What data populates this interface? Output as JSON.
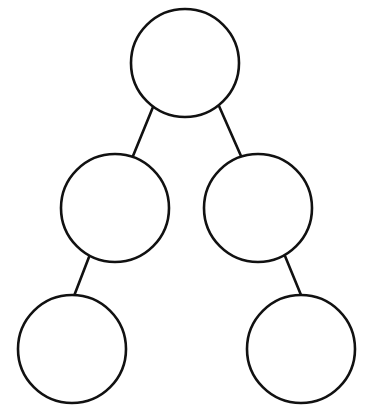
{
  "diagram": {
    "type": "binary-tree",
    "background": "#ffffff",
    "stroke_color": "#111111",
    "nodes": [
      {
        "id": "root",
        "label": "",
        "cx": 185,
        "cy": 63,
        "r": 54
      },
      {
        "id": "left-mid",
        "label": "",
        "cx": 115,
        "cy": 208,
        "r": 54
      },
      {
        "id": "right-mid",
        "label": "",
        "cx": 258,
        "cy": 208,
        "r": 54
      },
      {
        "id": "bottom-left",
        "label": "",
        "cx": 72,
        "cy": 349,
        "r": 54
      },
      {
        "id": "bottom-right",
        "label": "",
        "cx": 301,
        "cy": 349,
        "r": 54
      }
    ],
    "edges": [
      {
        "from": "root",
        "to": "left-mid",
        "x1": 153,
        "y1": 107,
        "x2": 133,
        "y2": 156
      },
      {
        "from": "root",
        "to": "right-mid",
        "x1": 219,
        "y1": 106,
        "x2": 241,
        "y2": 156
      },
      {
        "from": "left-mid",
        "to": "bottom-left",
        "x1": 89,
        "y1": 257,
        "x2": 74,
        "y2": 296
      },
      {
        "from": "right-mid",
        "to": "bottom-right",
        "x1": 285,
        "y1": 256,
        "x2": 301,
        "y2": 295
      }
    ]
  }
}
